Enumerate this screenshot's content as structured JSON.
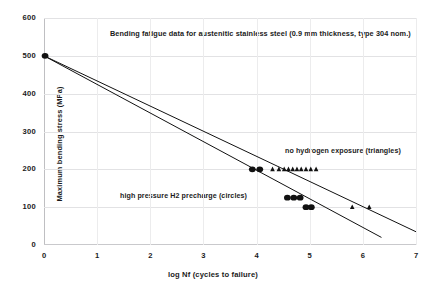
{
  "chart_data": {
    "type": "scatter",
    "title": "Bending fatigue data for austenitic stainless steel  (0.9 mm thickness, type 304 nom.)",
    "xlabel": "log Nf (cycles to failure)",
    "ylabel": "Maximum bending stress (MPa)",
    "xlim": [
      0,
      7
    ],
    "ylim": [
      0,
      600
    ],
    "xticks": [
      "0",
      "1",
      "2",
      "3",
      "4",
      "5",
      "6",
      "7"
    ],
    "yticks": [
      "0",
      "100",
      "200",
      "300",
      "400",
      "500",
      "600"
    ],
    "grid": "horizontal-and-vertical-light",
    "legend_position": "inline-annotations",
    "annotations": [
      {
        "id": "no-hydrogen",
        "text": "no hydrogen exposure (triangles)",
        "marker": "triangle",
        "x": 5.35,
        "y": 258
      },
      {
        "id": "h2-precharge",
        "text": "high pressure H2 precharge (circles)",
        "marker": "circle",
        "x": 2.45,
        "y": 143
      }
    ],
    "series": [
      {
        "name": "no hydrogen exposure",
        "marker": "triangle",
        "color": "#111111",
        "points": [
          {
            "x": 0.02,
            "y": 500
          },
          {
            "x": 4.3,
            "y": 200
          },
          {
            "x": 4.42,
            "y": 200
          },
          {
            "x": 4.52,
            "y": 200
          },
          {
            "x": 4.6,
            "y": 200
          },
          {
            "x": 4.68,
            "y": 200
          },
          {
            "x": 4.76,
            "y": 200
          },
          {
            "x": 4.84,
            "y": 200
          },
          {
            "x": 4.93,
            "y": 200
          },
          {
            "x": 5.02,
            "y": 200
          },
          {
            "x": 5.12,
            "y": 200
          },
          {
            "x": 5.8,
            "y": 100
          },
          {
            "x": 6.12,
            "y": 100
          }
        ],
        "fit_line": {
          "x0": 0.0,
          "y0": 500,
          "x1": 7.0,
          "y1": 35
        }
      },
      {
        "name": "high pressure H2 precharge",
        "marker": "circle",
        "color": "#111111",
        "points": [
          {
            "x": 0.02,
            "y": 500
          },
          {
            "x": 3.92,
            "y": 200
          },
          {
            "x": 4.06,
            "y": 200
          },
          {
            "x": 4.58,
            "y": 125
          },
          {
            "x": 4.7,
            "y": 125
          },
          {
            "x": 4.82,
            "y": 125
          },
          {
            "x": 4.93,
            "y": 100
          },
          {
            "x": 5.03,
            "y": 100
          }
        ],
        "fit_line": {
          "x0": 0.0,
          "y0": 500,
          "x1": 6.35,
          "y1": 20
        }
      }
    ]
  }
}
